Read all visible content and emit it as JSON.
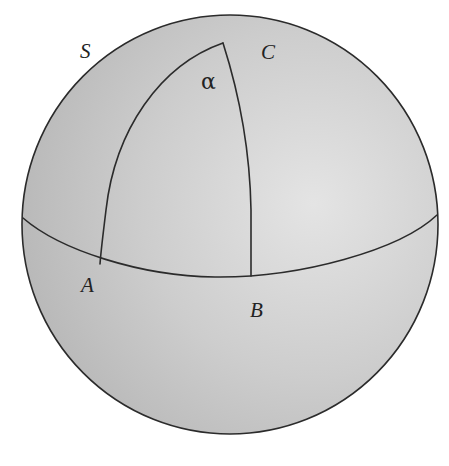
{
  "diagram": {
    "type": "spherical-triangle-on-sphere",
    "colors": {
      "background": "#ffffff",
      "sphere_fill_dark": "#b9b9b9",
      "sphere_fill_light": "#e2e2e2",
      "stroke": "#2b2b2b",
      "text": "#222222"
    },
    "labels": {
      "sphere": "S",
      "circle": "C",
      "angle": "α",
      "point_a": "A",
      "point_b": "B"
    }
  }
}
